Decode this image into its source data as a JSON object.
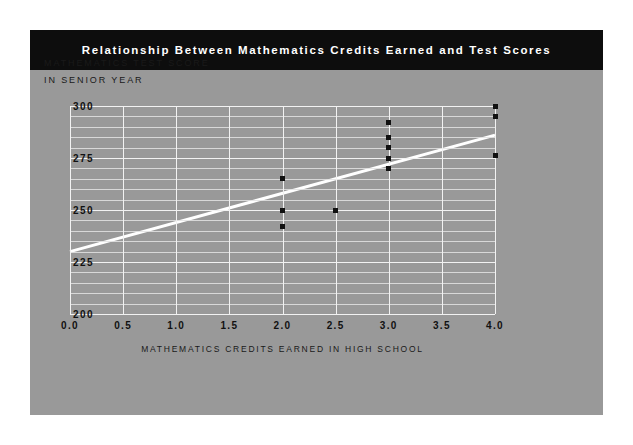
{
  "chart_data": {
    "type": "scatter",
    "title": "Relationship Between Mathematics Credits Earned and Test Scores",
    "xlabel": "MATHEMATICS CREDITS EARNED IN HIGH SCHOOL",
    "ylabel_line1": "MATHEMATICS TEST SCORE",
    "ylabel_line2": "IN SENIOR YEAR",
    "xlim": [
      0.0,
      4.0
    ],
    "ylim": [
      200,
      300
    ],
    "xticks": [
      "0.0",
      "0.5",
      "1.0",
      "1.5",
      "2.0",
      "2.5",
      "3.0",
      "3.5",
      "4.0"
    ],
    "xtick_values": [
      0.0,
      0.5,
      1.0,
      1.5,
      2.0,
      2.5,
      3.0,
      3.5,
      4.0
    ],
    "yticks": [
      "300",
      "275",
      "250",
      "225",
      "200"
    ],
    "ytick_values": [
      300,
      275,
      250,
      225,
      200
    ],
    "y_minor_step": 5,
    "grid": true,
    "legend": "none",
    "points": [
      {
        "x": 2.0,
        "y": 265
      },
      {
        "x": 2.0,
        "y": 250
      },
      {
        "x": 2.0,
        "y": 242
      },
      {
        "x": 2.5,
        "y": 250
      },
      {
        "x": 3.0,
        "y": 292
      },
      {
        "x": 3.0,
        "y": 285
      },
      {
        "x": 3.0,
        "y": 280
      },
      {
        "x": 3.0,
        "y": 275
      },
      {
        "x": 3.0,
        "y": 270
      },
      {
        "x": 4.0,
        "y": 300
      },
      {
        "x": 4.0,
        "y": 295
      },
      {
        "x": 4.0,
        "y": 276
      }
    ],
    "fit_line": {
      "name": "regression line",
      "x": [
        0.0,
        4.0
      ],
      "y": [
        230,
        286
      ],
      "color": "#ffffff"
    },
    "colors": {
      "panel_background": "#999999",
      "title_bar": "#0d0d0d",
      "title_text": "#ffffff",
      "grid": "#f2f2f2",
      "marker": "#111111",
      "page_background": "#ffffff"
    }
  }
}
